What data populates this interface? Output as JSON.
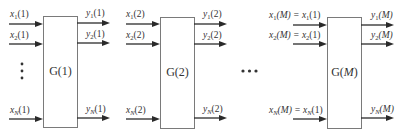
{
  "diagram": {
    "blocks": [
      {
        "name": "G(1)",
        "label_main": "G(",
        "label_arg": "1",
        "label_end": ")",
        "inputs": [
          {
            "var": "x",
            "sub": "1",
            "arg": "(1)",
            "eq": ""
          },
          {
            "var": "x",
            "sub": "2",
            "arg": "(1)",
            "eq": ""
          },
          {
            "var": "x",
            "sub": "N",
            "arg": "(1)",
            "eq": ""
          }
        ],
        "outputs": [
          {
            "var": "y",
            "sub": "1",
            "arg": "(1)"
          },
          {
            "var": "y",
            "sub": "2",
            "arg": "(1)"
          },
          {
            "var": "y",
            "sub": "N",
            "arg": "(1)"
          }
        ]
      },
      {
        "name": "G(2)",
        "label_main": "G(",
        "label_arg": "2",
        "label_end": ")",
        "inputs": [
          {
            "var": "x",
            "sub": "1",
            "arg": "(2)",
            "eq": ""
          },
          {
            "var": "x",
            "sub": "2",
            "arg": "(2)",
            "eq": ""
          },
          {
            "var": "x",
            "sub": "N",
            "arg": "(2)",
            "eq": ""
          }
        ],
        "outputs": [
          {
            "var": "y",
            "sub": "1",
            "arg": "(2)"
          },
          {
            "var": "y",
            "sub": "2",
            "arg": "(2)"
          },
          {
            "var": "y",
            "sub": "N",
            "arg": "(2)"
          }
        ]
      },
      {
        "name": "G(M)",
        "label_main": "G(",
        "label_arg": "M",
        "label_end": ")",
        "inputs": [
          {
            "var": "x",
            "sub": "1",
            "arg": "(M)",
            "eq": " = x",
            "eq_sub": "1",
            "eq_arg": "(1)"
          },
          {
            "var": "x",
            "sub": "2",
            "arg": "(M)",
            "eq": " = x",
            "eq_sub": "2",
            "eq_arg": "(1)"
          },
          {
            "var": "x",
            "sub": "N",
            "arg": "(M)",
            "eq": " = x",
            "eq_sub": "N",
            "eq_arg": "(1)"
          }
        ],
        "outputs": [
          {
            "var": "y",
            "sub": "1",
            "arg": "(M)"
          },
          {
            "var": "y",
            "sub": "2",
            "arg": "(M)"
          },
          {
            "var": "y",
            "sub": "N",
            "arg": "(M)"
          }
        ]
      }
    ],
    "vertical_ellipsis": "⋮",
    "horizontal_ellipsis": "•••"
  }
}
